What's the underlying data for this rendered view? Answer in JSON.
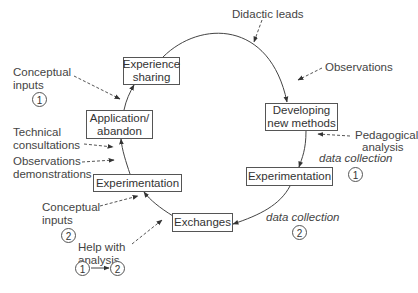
{
  "diagram": {
    "type": "cycle",
    "nodes": [
      {
        "id": "experience_sharing",
        "label_lines": [
          "Experience",
          "sharing"
        ]
      },
      {
        "id": "developing_new_methods",
        "label_lines": [
          "Developing",
          "new methods"
        ]
      },
      {
        "id": "experimentation_1",
        "label": "Experimentation"
      },
      {
        "id": "exchanges",
        "label": "Exchanges"
      },
      {
        "id": "experimentation_2",
        "label": "Experimentation"
      },
      {
        "id": "application_abandon",
        "label_lines": [
          "Application/",
          "abandon"
        ]
      }
    ],
    "inputs": {
      "didactic_leads": "Didactic leads",
      "observations": "Observations",
      "pedagogical_analysis": [
        "Pedagogical",
        "analysis"
      ],
      "data_collection_1": "data collection",
      "data_collection_1_num": "1",
      "data_collection_2": "data collection",
      "data_collection_2_num": "2",
      "conceptual_inputs_1": [
        "Conceptual",
        "inputs"
      ],
      "conceptual_inputs_1_num": "1",
      "technical_consultations": [
        "Technical",
        "consultations"
      ],
      "observations_demonstrations": [
        "Observations",
        "demonstrations"
      ],
      "conceptual_inputs_2": [
        "Conceptual",
        "inputs"
      ],
      "conceptual_inputs_2_num": "2",
      "help_with_analysis": [
        "Help with",
        "analysis"
      ],
      "help_from": "1",
      "help_to": "2"
    }
  }
}
